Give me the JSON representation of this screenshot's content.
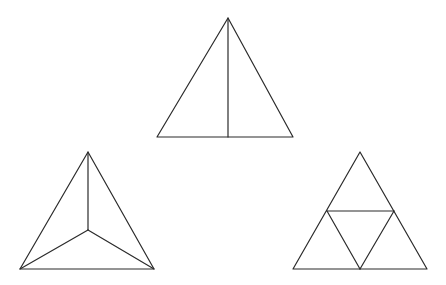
{
  "diagram": {
    "background": "#ffffff",
    "stroke_color": "#2b2b2b",
    "figures": [
      {
        "name": "triangle-bisected",
        "description": "Triangle divided by a vertical line from apex to base midpoint",
        "outline": [
          [
            228,
            18
          ],
          [
            157,
            137
          ],
          [
            293,
            137
          ]
        ],
        "segments": [
          [
            [
              228,
              18
            ],
            [
              228,
              137
            ]
          ]
        ]
      },
      {
        "name": "triangle-centroid-split",
        "description": "Triangle divided into three parts by lines from each vertex to an interior point",
        "outline": [
          [
            88,
            152
          ],
          [
            20,
            269
          ],
          [
            154,
            269
          ]
        ],
        "segments": [
          [
            [
              88,
              152
            ],
            [
              88,
              230
            ]
          ],
          [
            [
              88,
              230
            ],
            [
              20,
              269
            ]
          ],
          [
            [
              88,
              230
            ],
            [
              154,
              269
            ]
          ]
        ]
      },
      {
        "name": "triangle-four-subdivided",
        "description": "Triangle divided into four smaller triangles by joining side midpoints",
        "outline": [
          [
            360,
            152
          ],
          [
            293,
            269
          ],
          [
            427,
            269
          ]
        ],
        "segments": [
          [
            [
              327,
              211
            ],
            [
              394,
              211
            ]
          ],
          [
            [
              327,
              211
            ],
            [
              360,
              269
            ]
          ],
          [
            [
              394,
              211
            ],
            [
              360,
              269
            ]
          ]
        ]
      }
    ]
  }
}
